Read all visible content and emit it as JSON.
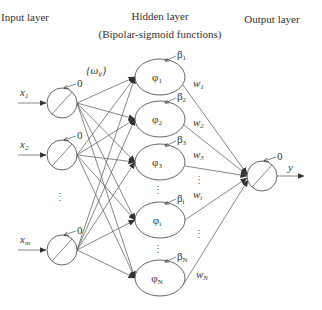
{
  "headers": {
    "input_layer": "Input layer",
    "hidden_layer": "Hidden layer",
    "hidden_subtitle": "(Bipolar-sigmoid functions)",
    "output_layer": "Output layer"
  },
  "input_nodes": [
    {
      "label": "x",
      "sub": "1",
      "bias": "0"
    },
    {
      "label": "x",
      "sub": "2",
      "bias": "0"
    },
    {
      "label": "x",
      "sub": "m",
      "bias": "0"
    }
  ],
  "input_weights_label": "{ω",
  "input_weights_sub": "ij",
  "input_weights_close": "}",
  "hidden_nodes": [
    {
      "label": "φ",
      "sub": "1",
      "beta": "β",
      "beta_sub": "1",
      "weight": "w",
      "weight_sub": "1"
    },
    {
      "label": "φ",
      "sub": "2",
      "beta": "β",
      "beta_sub": "2",
      "weight": "w",
      "weight_sub": "2"
    },
    {
      "label": "φ",
      "sub": "3",
      "beta": "β",
      "beta_sub": "3",
      "weight": "w",
      "weight_sub": "3"
    },
    {
      "label": "φ",
      "sub": "i",
      "beta": "β",
      "beta_sub": "i",
      "weight": "w",
      "weight_sub": "i"
    },
    {
      "label": "φ",
      "sub": "N",
      "beta": "β",
      "beta_sub": "N",
      "weight": "w",
      "weight_sub": "N"
    }
  ],
  "output_node": {
    "label": "y",
    "bias": "0"
  },
  "ellipsis": "⋮",
  "colors": {
    "stroke": "#555555",
    "text": "#333333",
    "background": "#ffffff"
  }
}
